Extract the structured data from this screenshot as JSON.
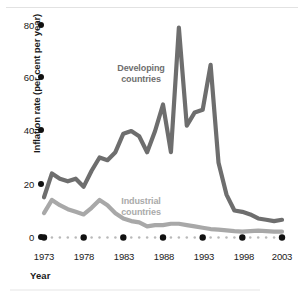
{
  "chart_data": {
    "type": "line",
    "title": "",
    "xlabel": "Year",
    "ylabel": "Inflation rate (per cent per year)",
    "xlim": [
      1973,
      2003
    ],
    "ylim": [
      0,
      80
    ],
    "xticks": [
      "1973",
      "1978",
      "1983",
      "1988",
      "1993",
      "1998",
      "2003"
    ],
    "yticks": [
      "0",
      "20",
      "40",
      "60",
      "80"
    ],
    "grid": false,
    "legend_position": "inline-annotation",
    "colors": {
      "developing": "#6e6e6e",
      "industrial": "#a8a8a8",
      "axis": "#111111",
      "text": "#1a1a1a",
      "background": "#ffffff"
    },
    "x": [
      1973,
      1974,
      1975,
      1976,
      1977,
      1978,
      1979,
      1980,
      1981,
      1982,
      1983,
      1984,
      1985,
      1986,
      1987,
      1988,
      1989,
      1990,
      1991,
      1992,
      1993,
      1994,
      1995,
      1996,
      1997,
      1998,
      1999,
      2000,
      2001,
      2002,
      2003
    ],
    "series": [
      {
        "name": "Developing countries",
        "color": "#6e6e6e",
        "values": [
          15,
          24,
          22,
          21,
          22,
          19,
          25,
          30,
          29,
          32,
          39,
          40,
          38,
          32,
          40,
          50,
          32,
          79,
          42,
          47,
          48,
          65,
          28,
          16,
          10,
          9.5,
          8.5,
          7,
          6.5,
          6,
          6.5
        ]
      },
      {
        "name": "Industrial countries",
        "color": "#a8a8a8",
        "values": [
          9,
          14,
          12,
          10.5,
          9.5,
          8.5,
          11,
          14,
          12,
          9,
          7,
          6,
          5.5,
          4,
          4.5,
          4.5,
          5,
          5,
          4.5,
          4,
          3.5,
          3,
          2.8,
          2.5,
          2.2,
          2,
          2.2,
          2.4,
          2.2,
          2,
          2
        ]
      }
    ]
  },
  "annotations": [
    {
      "name": "developing-label",
      "text": "Developing\ncountries",
      "color": "#6e6e6e"
    },
    {
      "name": "industrial-label",
      "text": "Industrial\ncountries",
      "color": "#a8a8a8"
    }
  ]
}
